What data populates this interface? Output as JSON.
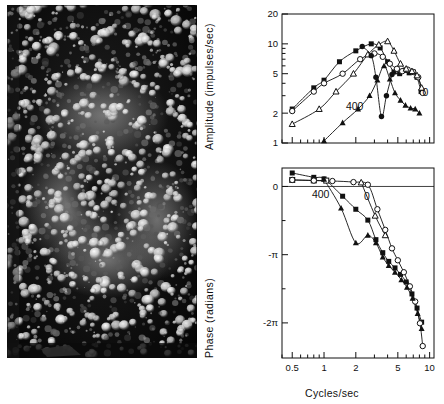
{
  "figure": {
    "panels": [
      "photomicrograph",
      "amplitude-plot",
      "phase-plot"
    ]
  },
  "photo": {
    "name": "retina-photomicrograph",
    "description": "Dark-field photomicrograph of a retinal receptor mosaic with bright cell profiles arranged in rings"
  },
  "chart_data": [
    {
      "type": "line",
      "panel": "amplitude",
      "title": "",
      "xlabel": "",
      "ylabel": "Amplitude  (impulses/sec)",
      "xscale": "log",
      "yscale": "log",
      "xlim": [
        0.4,
        11
      ],
      "ylim": [
        1,
        20
      ],
      "xticks": [
        0.5,
        1,
        2,
        5,
        10
      ],
      "xticklabels": [
        "0.5",
        "1",
        "2",
        "5",
        "10"
      ],
      "yticks": [
        1,
        2,
        5,
        10,
        20
      ],
      "yticklabels": [
        "1",
        "2",
        "5",
        "10",
        "20"
      ],
      "grid": false,
      "legend": "none",
      "annotations": [
        {
          "text": "400",
          "x": 1.95,
          "y": 2.15
        },
        {
          "text": "0",
          "x": 9.1,
          "y": 3.0
        }
      ],
      "series": [
        {
          "name": "filled-square",
          "marker": "filled-square",
          "x": [
            0.5,
            0.8,
            1.0,
            1.4,
            2.0,
            2.8,
            3.4,
            4.0,
            4.6,
            5.2,
            5.8,
            6.4,
            7.0,
            7.6,
            8.3
          ],
          "values": [
            2.2,
            3.6,
            4.3,
            6.6,
            8.5,
            10.0,
            9.1,
            6.6,
            5.2,
            5.0,
            5.4,
            5.1,
            5.2,
            4.6,
            3.3
          ]
        },
        {
          "name": "open-circle",
          "marker": "open-circle",
          "x": [
            0.5,
            0.8,
            1.0,
            1.5,
            2.2,
            3.0,
            3.6,
            4.2,
            4.9,
            5.5,
            6.2,
            7.0,
            7.8,
            8.6
          ],
          "values": [
            2.1,
            3.3,
            4.0,
            5.0,
            7.0,
            8.0,
            7.4,
            6.3,
            5.6,
            5.3,
            5.5,
            5.2,
            4.6,
            3.2
          ]
        },
        {
          "name": "open-triangle",
          "marker": "open-triangle",
          "x": [
            0.5,
            0.9,
            1.3,
            1.9,
            2.6,
            3.3,
            4.0,
            4.6,
            5.3,
            6.0,
            6.8,
            7.6,
            8.4
          ],
          "values": [
            1.55,
            2.2,
            3.3,
            5.0,
            7.8,
            9.8,
            10.6,
            8.5,
            6.3,
            5.6,
            5.3,
            4.8,
            3.6
          ]
        },
        {
          "name": "filled-triangle",
          "marker": "filled-triangle",
          "x": [
            1.0,
            1.5,
            2.1,
            2.7,
            3.2,
            3.7,
            4.2,
            4.7,
            5.3,
            5.9,
            6.6,
            7.3,
            8.0
          ],
          "values": [
            1.05,
            1.6,
            2.2,
            3.0,
            4.3,
            6.0,
            4.4,
            3.2,
            2.7,
            2.4,
            2.25,
            2.2,
            2.0
          ]
        },
        {
          "name": "filled-circle-dip",
          "marker": "filled-circle",
          "x": [
            2.3,
            2.8,
            3.1,
            3.5,
            3.9,
            4.4
          ],
          "values": [
            9.4,
            7.6,
            4.6,
            1.85,
            3.0,
            4.9
          ]
        }
      ]
    },
    {
      "type": "line",
      "panel": "phase",
      "title": "",
      "xlabel": "Cycles/sec",
      "ylabel": "Phase  (radians)",
      "xscale": "log",
      "yscale": "linear",
      "xlim": [
        0.4,
        11
      ],
      "ylim": [
        -7.9,
        0.85
      ],
      "xticks": [
        0.5,
        1,
        2,
        5,
        10
      ],
      "xticklabels": [
        "0.5",
        "1",
        "2",
        "5",
        "10"
      ],
      "yticks": [
        0,
        -1.5708,
        -3.1416,
        -4.7124,
        -6.2832
      ],
      "yticklabels": [
        "0",
        "",
        "-π",
        "",
        "-2π"
      ],
      "grid": false,
      "legend": "none",
      "annotations": [
        {
          "text": "400",
          "x": 0.93,
          "y": -0.55
        },
        {
          "text": "0",
          "x": 2.55,
          "y": -0.62
        }
      ],
      "series": [
        {
          "name": "filled-square",
          "marker": "filled-square",
          "x": [
            0.5,
            0.8,
            1.0,
            1.5,
            2.0,
            2.6,
            3.1,
            3.6,
            4.1,
            4.7,
            5.3,
            6.0,
            6.8,
            7.6,
            8.4
          ],
          "values": [
            0.62,
            0.42,
            0.35,
            -0.45,
            -1.05,
            -1.55,
            -2.45,
            -3.05,
            -3.45,
            -3.75,
            -4.05,
            -4.4,
            -4.95,
            -5.6,
            -6.25
          ]
        },
        {
          "name": "open-square",
          "marker": "open-square",
          "x": [
            0.5,
            0.8,
            1.05
          ],
          "values": [
            0.3,
            0.28,
            0.27
          ]
        },
        {
          "name": "open-circle",
          "marker": "open-circle",
          "x": [
            0.5,
            0.8,
            1.2,
            1.9,
            2.6,
            3.2,
            3.8,
            4.4,
            5.0,
            5.7,
            6.5,
            7.3,
            8.1,
            8.6
          ],
          "values": [
            0.3,
            0.27,
            0.25,
            0.2,
            0.08,
            -1.05,
            -2.0,
            -2.85,
            -3.4,
            -3.95,
            -4.6,
            -5.3,
            -6.3,
            -7.35
          ]
        },
        {
          "name": "open-triangle",
          "marker": "open-triangle",
          "x": [
            2.25,
            3.05,
            3.8
          ],
          "values": [
            0.18,
            -1.35,
            -2.25
          ]
        },
        {
          "name": "filled-triangle",
          "marker": "filled-triangle",
          "x": [
            1.0,
            1.45,
            2.0,
            2.6,
            3.1,
            3.6,
            4.1,
            4.7,
            5.4,
            6.1,
            6.9,
            7.7,
            8.4
          ],
          "values": [
            0.33,
            -1.0,
            -2.6,
            -2.25,
            -2.6,
            -3.25,
            -3.65,
            -3.95,
            -4.3,
            -4.65,
            -5.15,
            -5.85,
            -6.55
          ]
        }
      ]
    }
  ]
}
